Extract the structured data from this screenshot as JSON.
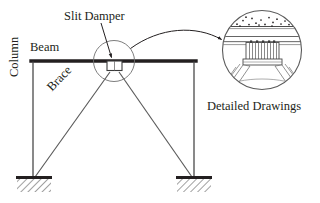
{
  "figure": {
    "type": "structural-engineering-diagram"
  },
  "labels": {
    "slit_damper": "Slit Damper",
    "beam": "Beam",
    "column": "Column",
    "brace": "Brace",
    "detailed_drawings": "Detailed Drawings"
  },
  "colors": {
    "ink": "#231f20",
    "line": "#3a3a3a",
    "thin": "#6e6e6e",
    "background": "#ffffff"
  },
  "frame": {
    "beam": {
      "x1": 32,
      "y1": 61,
      "x2": 196,
      "y2": 61,
      "thickness": 3.2
    },
    "column_left": {
      "x1": 33,
      "y1": 61,
      "x2": 33,
      "y2": 179,
      "thickness": 1.2
    },
    "column_right": {
      "x1": 194,
      "y1": 61,
      "x2": 194,
      "y2": 179,
      "thickness": 1.2
    },
    "brace_left": {
      "x1": 34,
      "y1": 178,
      "x2": 112,
      "y2": 70
    },
    "brace_right": {
      "x1": 193,
      "y1": 178,
      "x2": 117,
      "y2": 70
    }
  },
  "supports": [
    {
      "name": "support-left",
      "x": 16,
      "y": 177,
      "width": 36,
      "height": 7,
      "hatch": true
    },
    {
      "name": "support-right",
      "x": 176,
      "y": 177,
      "width": 36,
      "height": 7,
      "hatch": true
    }
  ],
  "callout": {
    "source_circle": {
      "cx": 114,
      "cy": 61,
      "r": 20
    },
    "detail_circle": {
      "cx": 262,
      "cy": 50,
      "r": 40
    },
    "leader_arrow_to_damper": {
      "from": [
        100,
        22
      ],
      "to": [
        110,
        56
      ]
    },
    "leader_curve_to_detail": {
      "from": [
        131,
        47
      ],
      "to": [
        222,
        40
      ]
    }
  },
  "detail_components": {
    "slab": "concrete slab with aggregate",
    "beam_flanges": "steel beam upper and lower flange",
    "slit_damper_plate": "slit damper plate with vertical slits",
    "gusset": "gusset plate",
    "braces": "double-angle braces"
  }
}
